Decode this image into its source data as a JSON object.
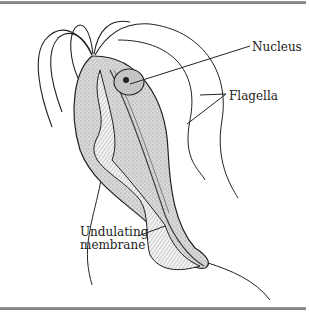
{
  "diagram": {
    "labels": {
      "nucleus": "Nucleus",
      "flagella": "Flagella",
      "membrane_line1": "Undulating",
      "membrane_line2": "membrane"
    },
    "colors": {
      "rule": "#8a8a8a",
      "ink": "#222222",
      "cell_fill": "#cfcfcf",
      "background": "#ffffff"
    }
  }
}
